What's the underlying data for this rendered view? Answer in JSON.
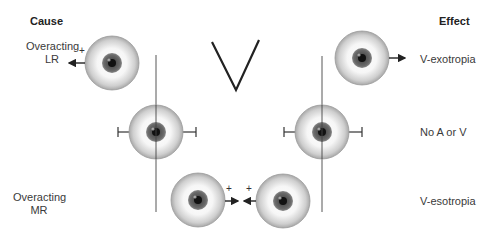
{
  "headers": {
    "cause": "Cause",
    "effect": "Effect"
  },
  "causes": [
    {
      "line1": "Overacting",
      "line2": "LR"
    },
    {
      "line1": "Overacting",
      "line2": "MR"
    }
  ],
  "effects": [
    {
      "label": "V-exotropia"
    },
    {
      "label": "No A or V"
    },
    {
      "label": "V-esotropia"
    }
  ],
  "symbol": {
    "pattern": "V"
  },
  "plus_sign": "+",
  "colors": {
    "line": "#333333",
    "iris": "#555555",
    "pupil": "#111111",
    "sclera_edge": "#9a9a9a"
  }
}
